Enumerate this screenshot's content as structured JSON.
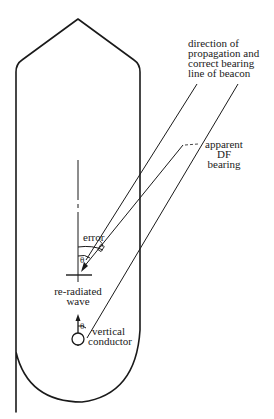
{
  "diagram": {
    "labels": {
      "propagation": [
        "direction of",
        "propagation and",
        "correct bearing",
        "line of beacon"
      ],
      "apparent": [
        "apparent",
        "DF",
        "bearing"
      ],
      "error": "error",
      "theta_upper": "θ",
      "theta_lower": "θ",
      "reradiated": [
        "re-radiated",
        "wave"
      ],
      "conductor": [
        "vertical",
        "conductor"
      ]
    },
    "colors": {
      "stroke": "#1a1a1a",
      "background": "#ffffff"
    }
  }
}
